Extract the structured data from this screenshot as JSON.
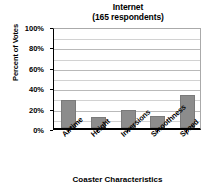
{
  "chart_data": {
    "type": "bar",
    "title": "Internet",
    "subtitle": "(165 respondents)",
    "xlabel": "Coaster Characteristics",
    "ylabel": "Percent of Votes",
    "categories": [
      "Airtime",
      "Height",
      "Inversions",
      "Smoothness",
      "Speed"
    ],
    "values": [
      27,
      11,
      18,
      12,
      32
    ],
    "ylim": [
      0,
      100
    ],
    "ytick_labels": [
      "0%",
      "20%",
      "40%",
      "60%",
      "80%",
      "100%"
    ],
    "ytick_values": [
      0,
      20,
      40,
      60,
      80,
      100
    ],
    "minor_gridline_values": [
      10,
      30,
      50,
      70,
      90
    ],
    "grid": true,
    "legend": "none",
    "bar_color": "#8c8c8c",
    "axis_color": "#000000",
    "gridline_color": "#b9b9b9"
  }
}
